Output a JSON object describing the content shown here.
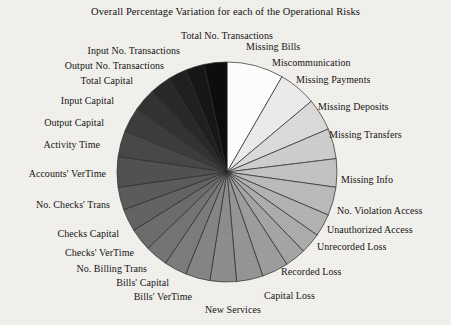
{
  "chart_data": {
    "type": "pie",
    "title": "Overall Percentage Variation for each of the Operational Risks",
    "xlabel": "",
    "ylabel": "",
    "legend_position": "none",
    "grid": false,
    "start_angle_deg": 0,
    "direction": "clockwise",
    "center": {
      "x": 227,
      "y": 172,
      "radius": 110
    },
    "categories": [
      "Missing Bills",
      "Miscommunication",
      "Missing Payments",
      "Missing Deposits",
      "Missing Transfers",
      "Missing Info",
      "No. Violation Access",
      "Unauthorized Access",
      "Unrecorded Loss",
      "Recorded Loss",
      "Capital Loss",
      "New Services",
      "Bills' VerTime",
      "Bills' Capital",
      "No. Billing Trans",
      "Checks' VerTime",
      "Checks Capital",
      "No. Checks' Trans",
      "Accounts' VerTime",
      "Activity Time",
      "Output Capital",
      "Input Capital",
      "Total Capital",
      "Output No. Transactions",
      "Input No. Transactions",
      "Total No. Transactions"
    ],
    "values": [
      8.3,
      5.6,
      4.7,
      4.4,
      4.2,
      4.2,
      3.3,
      3.1,
      3.1,
      3.9,
      3.9,
      3.9,
      3.6,
      3.3,
      3.3,
      3.3,
      3.3,
      3.3,
      4.4,
      3.9,
      3.6,
      3.3,
      3.1,
      2.8,
      2.8,
      3.3
    ],
    "slice_angles_deg": [
      30,
      20,
      17,
      16,
      15,
      15,
      12,
      11,
      11,
      14,
      14,
      14,
      13,
      12,
      12,
      12,
      12,
      12,
      16,
      14,
      13,
      12,
      11,
      10,
      10,
      12
    ],
    "slice_colors": [
      "#ffffff",
      "#ededed",
      "#dcdcdc",
      "#cfcfcf",
      "#c4c4c4",
      "#bcbcbc",
      "#b4b4b4",
      "#adadad",
      "#a6a6a6",
      "#9e9e9e",
      "#969696",
      "#8e8e8e",
      "#868686",
      "#7d7d7d",
      "#757575",
      "#6d6d6d",
      "#646464",
      "#5c5c5c",
      "#525252",
      "#484848",
      "#3d3d3d",
      "#333333",
      "#292929",
      "#202020",
      "#171717",
      "#0d0d0d"
    ],
    "labels": [
      {
        "text": "Missing Bills",
        "x": 246,
        "y": 41,
        "align": "right"
      },
      {
        "text": "Miscommunication",
        "x": 272,
        "y": 57,
        "align": "right"
      },
      {
        "text": "Missing Payments",
        "x": 296,
        "y": 74,
        "align": "right"
      },
      {
        "text": "Missing Deposits",
        "x": 318,
        "y": 101,
        "align": "right"
      },
      {
        "text": "Missing Transfers",
        "x": 329,
        "y": 129,
        "align": "right"
      },
      {
        "text": "Missing Info",
        "x": 341,
        "y": 174,
        "align": "right"
      },
      {
        "text": "No. Violation Access",
        "x": 337,
        "y": 205,
        "align": "right"
      },
      {
        "text": "Unauthorized Access",
        "x": 327,
        "y": 224,
        "align": "right"
      },
      {
        "text": "Unrecorded Loss",
        "x": 317,
        "y": 241,
        "align": "right"
      },
      {
        "text": "Recorded Loss",
        "x": 281,
        "y": 266,
        "align": "right"
      },
      {
        "text": "Capital Loss",
        "x": 264,
        "y": 290,
        "align": "right"
      },
      {
        "text": "New Services",
        "x": 205,
        "y": 304,
        "align": "right"
      },
      {
        "text": "Bills' VerTime",
        "x": 192,
        "y": 291,
        "align": "left"
      },
      {
        "text": "Bills' Capital",
        "x": 169,
        "y": 277,
        "align": "left"
      },
      {
        "text": "No. Billing Trans",
        "x": 147,
        "y": 263,
        "align": "left"
      },
      {
        "text": "Checks' VerTime",
        "x": 134,
        "y": 247,
        "align": "left"
      },
      {
        "text": "Checks Capital",
        "x": 119,
        "y": 228,
        "align": "left"
      },
      {
        "text": "No. Checks' Trans",
        "x": 110,
        "y": 199,
        "align": "left"
      },
      {
        "text": "Accounts' VerTime",
        "x": 106,
        "y": 168,
        "align": "left"
      },
      {
        "text": "Activity Time",
        "x": 100,
        "y": 139,
        "align": "left"
      },
      {
        "text": "Output Capital",
        "x": 104,
        "y": 117,
        "align": "left"
      },
      {
        "text": "Input Capital",
        "x": 114,
        "y": 95,
        "align": "left"
      },
      {
        "text": "Total Capital",
        "x": 133,
        "y": 75,
        "align": "left"
      },
      {
        "text": "Output No. Transactions",
        "x": 164,
        "y": 60,
        "align": "left"
      },
      {
        "text": "Input No. Transactions",
        "x": 180,
        "y": 45,
        "align": "left"
      },
      {
        "text": "Total No. Transactions",
        "x": 227,
        "y": 30,
        "align": "center"
      }
    ]
  }
}
